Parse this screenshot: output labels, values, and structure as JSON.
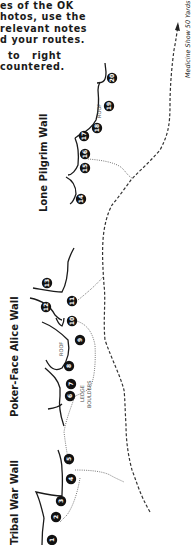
{
  "intro": {
    "lines": [
      "es of the OK",
      "hotos, use the",
      "relevant notes",
      "d your routes."
    ],
    "lines2": [
      "  to   right",
      "countered."
    ]
  },
  "approach": {
    "label": "Medicine Show 50 Yards"
  },
  "walls": [
    {
      "name": "Lone Pilgrim Wall",
      "routes": [
        "14",
        "15",
        "16",
        "17",
        "18",
        "19",
        "20"
      ]
    },
    {
      "name": "Poker-Face Alice Wall",
      "routes": [
        "6",
        "7",
        "8",
        "9",
        "10",
        "11",
        "12",
        "13"
      ]
    },
    {
      "name": "Tribal War Wall",
      "routes": [
        "1",
        "2",
        "3",
        "4",
        "5"
      ]
    }
  ],
  "features": {
    "roof_upper": "ROOF",
    "roof_lower": "ROOF",
    "ledge_line1": "LEDGE",
    "ledge_line2": "BOULDERS"
  },
  "routes": {
    "r1": "1",
    "r2": "2",
    "r3": "3",
    "r4": "4",
    "r5": "5",
    "r6": "6",
    "r7": "7",
    "r8": "8",
    "r9": "9",
    "r10": "10",
    "r11": "11",
    "r12": "12",
    "r13": "13",
    "r14": "14",
    "r15": "15",
    "r16": "16",
    "r17": "17",
    "r18": "18",
    "r19": "19",
    "r20": "20"
  },
  "colors": {
    "ink": "#1a1a1a",
    "marker_fill": "#111111",
    "marker_text": "#ffffff",
    "trail": "#333333"
  }
}
